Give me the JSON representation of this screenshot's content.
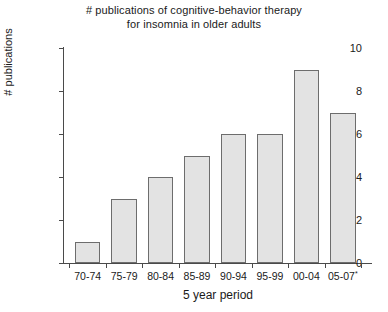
{
  "chart_data": {
    "type": "bar",
    "title": "# publications of cognitive-behavior therapy for insomnia in older adults",
    "title_lines": [
      "# publications of cognitive-behavior therapy",
      "for insomnia in older adults"
    ],
    "xlabel": "5 year period",
    "ylabel": "# publications",
    "categories": [
      "70-74",
      "75-79",
      "80-84",
      "85-89",
      "90-94",
      "95-99",
      "00-04",
      "05-07"
    ],
    "category_superscripts": [
      "",
      "",
      "",
      "",
      "",
      "",
      "",
      "*"
    ],
    "values": [
      1,
      3,
      4,
      5,
      6,
      6,
      9,
      7
    ],
    "ylim": [
      0,
      10
    ],
    "yticks": [
      0,
      2,
      4,
      6,
      8,
      10
    ],
    "ytick_labels": [
      "0",
      "2",
      "4",
      "6",
      "8",
      "10"
    ],
    "grid": false,
    "legend": null,
    "bar_fill_color": "#e3e3e3",
    "bar_edge_color": "#6d6d6d",
    "axis_color": "#4a4a4a",
    "background_color": "#ffffff"
  }
}
